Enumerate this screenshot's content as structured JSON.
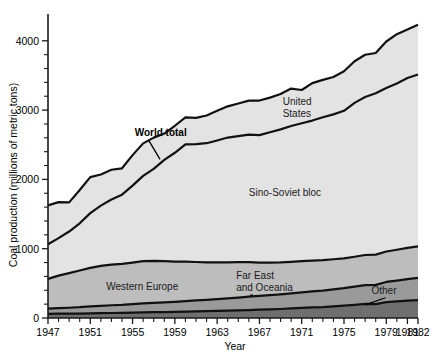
{
  "chart_data": {
    "type": "area",
    "title": "",
    "xlabel": "Year",
    "ylabel": "Coal production (millions of metric tons)",
    "xlim": [
      1947,
      1982
    ],
    "ylim": [
      0,
      4300
    ],
    "ytick_labels": [
      "0",
      "1000",
      "2000",
      "3000",
      "4000"
    ],
    "ytick_values": [
      0,
      1000,
      2000,
      3000,
      4000
    ],
    "ytick_minor_step": 200,
    "xtick_labels": [
      "1947",
      "1951",
      "1955",
      "1959",
      "1963",
      "1967",
      "1971",
      "1975",
      "1979",
      "1981",
      "1982"
    ],
    "xtick_values": [
      1947,
      1951,
      1955,
      1959,
      1963,
      1967,
      1971,
      1975,
      1979,
      1981,
      1982
    ],
    "xtick_minor_step": 1,
    "grid": false,
    "legend": "inline-annotations",
    "stacked": true,
    "stack_order_bottom_to_top": [
      "Other",
      "Far East and Oceania",
      "Western Europe",
      "Sino-Soviet bloc",
      "United States"
    ],
    "x": [
      1947,
      1948,
      1949,
      1950,
      1951,
      1952,
      1953,
      1954,
      1955,
      1956,
      1957,
      1958,
      1959,
      1960,
      1961,
      1962,
      1963,
      1964,
      1965,
      1966,
      1967,
      1968,
      1969,
      1970,
      1971,
      1972,
      1973,
      1974,
      1975,
      1976,
      1977,
      1978,
      1979,
      1980,
      1981,
      1982
    ],
    "series": [
      {
        "name": "Other",
        "color": "#6f6f6f",
        "values": [
          60,
          62,
          62,
          64,
          68,
          70,
          72,
          74,
          78,
          82,
          84,
          86,
          88,
          92,
          95,
          98,
          102,
          106,
          110,
          115,
          120,
          125,
          130,
          138,
          145,
          152,
          158,
          168,
          178,
          190,
          205,
          200,
          230,
          240,
          250,
          258
        ]
      },
      {
        "name": "Far East and Oceania",
        "color": "#9a9a9a",
        "values": [
          75,
          80,
          86,
          92,
          100,
          106,
          112,
          116,
          122,
          128,
          134,
          140,
          146,
          152,
          158,
          164,
          170,
          178,
          185,
          192,
          198,
          205,
          212,
          218,
          225,
          232,
          238,
          245,
          252,
          262,
          270,
          278,
          290,
          300,
          312,
          320
        ]
      },
      {
        "name": "Western Europe",
        "color": "#bdbdbd",
        "values": [
          430,
          470,
          500,
          530,
          555,
          575,
          585,
          590,
          600,
          610,
          605,
          595,
          580,
          570,
          555,
          540,
          530,
          520,
          510,
          500,
          480,
          470,
          460,
          455,
          450,
          445,
          440,
          435,
          430,
          432,
          434,
          436,
          440,
          445,
          450,
          455
        ]
      },
      {
        "name": "Sino-Soviet bloc",
        "color": "#e3e3e3",
        "values": [
          500,
          540,
          600,
          680,
          790,
          870,
          940,
          1000,
          1110,
          1230,
          1330,
          1460,
          1570,
          1690,
          1700,
          1720,
          1760,
          1800,
          1820,
          1840,
          1840,
          1880,
          1920,
          1960,
          1990,
          2020,
          2060,
          2090,
          2130,
          2220,
          2280,
          2330,
          2360,
          2400,
          2450,
          2480
        ]
      },
      {
        "name": "United States",
        "color": "#e3e3e3",
        "values": [
          560,
          520,
          420,
          480,
          520,
          450,
          430,
          380,
          440,
          470,
          450,
          380,
          390,
          390,
          380,
          400,
          430,
          450,
          470,
          490,
          500,
          500,
          510,
          540,
          480,
          540,
          540,
          540,
          570,
          600,
          610,
          580,
          670,
          710,
          700,
          720
        ]
      }
    ],
    "annotations": [
      {
        "id": "world-total",
        "text": "World total",
        "bold": true,
        "x": 1955.2,
        "y": 2620,
        "leader_to_x": 1957.6,
        "leader_to_y": 2290
      },
      {
        "id": "united-states",
        "text": "United States",
        "lines": [
          "United",
          "States"
        ],
        "x": 1969.2,
        "y": 3080
      },
      {
        "id": "sino-soviet-bloc",
        "text": "Sino-Soviet bloc",
        "x": 1966.0,
        "y": 1760
      },
      {
        "id": "western-europe",
        "text": "Western Europe",
        "x": 1952.5,
        "y": 400
      },
      {
        "id": "far-east-oceania",
        "text": "Far East and Oceania",
        "lines": [
          "Far East",
          "and Oceania"
        ],
        "x": 1964.8,
        "y": 560,
        "leader_to_x": 1966.4,
        "leader_to_y": 330
      },
      {
        "id": "other",
        "text": "Other",
        "x": 1977.6,
        "y": 350,
        "leader_to_x": 1977.0,
        "leader_to_y": 190
      }
    ]
  },
  "colors": {
    "outline": "#111111",
    "background": "#ffffff",
    "other": "#6f6f6f",
    "far_east": "#9a9a9a",
    "western_europe": "#bdbdbd",
    "sino_soviet": "#e3e3e3",
    "united_states": "#e3e3e3"
  }
}
